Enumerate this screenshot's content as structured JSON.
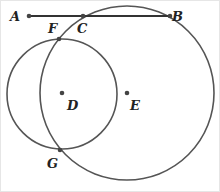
{
  "diagram": {
    "type": "geometry",
    "colors": {
      "stroke": "#555555",
      "point": "#444444",
      "label": "#222222",
      "border": "#dddddd"
    },
    "points": [
      {
        "id": "A",
        "label": "A",
        "x": 29,
        "y": 16,
        "lx": 10,
        "ly": 21
      },
      {
        "id": "B",
        "label": "B",
        "x": 170,
        "y": 16,
        "lx": 172,
        "ly": 21
      },
      {
        "id": "C",
        "label": "C",
        "x": 83,
        "y": 16,
        "lx": 77,
        "ly": 33
      },
      {
        "id": "F",
        "label": "F",
        "x": 59,
        "y": 39,
        "lx": 48,
        "ly": 33
      },
      {
        "id": "D",
        "label": "D",
        "x": 62,
        "y": 93,
        "lx": 67,
        "ly": 110
      },
      {
        "id": "E",
        "label": "E",
        "x": 127,
        "y": 93,
        "lx": 130,
        "ly": 110
      },
      {
        "id": "G",
        "label": "G",
        "x": 60,
        "y": 150,
        "lx": 47,
        "ly": 168
      }
    ],
    "segments": [
      {
        "from": "A",
        "to": "B"
      }
    ],
    "circles": [
      {
        "center": "D",
        "cx": 62,
        "cy": 94,
        "r": 55
      },
      {
        "center": "E",
        "cx": 127,
        "cy": 93,
        "r": 87
      }
    ]
  }
}
